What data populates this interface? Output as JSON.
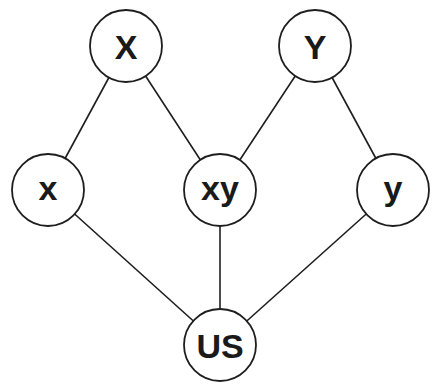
{
  "diagram": {
    "type": "graph",
    "colors": {
      "stroke": "#1e1e1e",
      "text": "#1a1a1a",
      "fill": "#ffffff",
      "background": "#ffffff"
    },
    "node_radius": 36,
    "nodes": [
      {
        "id": "X",
        "label": "X",
        "cx": 126,
        "cy": 46
      },
      {
        "id": "Y",
        "label": "Y",
        "cx": 315,
        "cy": 46
      },
      {
        "id": "x",
        "label": "x",
        "cx": 48,
        "cy": 190
      },
      {
        "id": "xy",
        "label": "xy",
        "cx": 220,
        "cy": 190
      },
      {
        "id": "y",
        "label": "y",
        "cx": 393,
        "cy": 190
      },
      {
        "id": "US",
        "label": "US",
        "cx": 220,
        "cy": 345
      }
    ],
    "edges": [
      {
        "from": "X",
        "to": "x"
      },
      {
        "from": "X",
        "to": "xy"
      },
      {
        "from": "Y",
        "to": "xy"
      },
      {
        "from": "Y",
        "to": "y"
      },
      {
        "from": "x",
        "to": "US"
      },
      {
        "from": "xy",
        "to": "US"
      },
      {
        "from": "y",
        "to": "US"
      }
    ]
  }
}
